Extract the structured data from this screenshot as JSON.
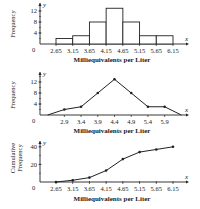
{
  "chart_data": [
    {
      "type": "bar",
      "subtype": "histogram",
      "title": "",
      "xlabel": "Milliequivalents per Liter",
      "ylabel": "Frequency",
      "x_axis_var": "x",
      "y_axis_var": "y",
      "origin_label": "0",
      "boundaries": [
        "2.65",
        "3.15",
        "3.65",
        "4.15",
        "4.65",
        "5.15",
        "5.65",
        "6.15"
      ],
      "categories": [
        "2.65-3.15",
        "3.15-3.65",
        "3.65-4.15",
        "4.15-4.65",
        "4.65-5.15",
        "5.15-5.65",
        "5.65-6.15"
      ],
      "values": [
        2,
        3,
        8,
        13,
        8,
        3,
        3
      ],
      "yticks": [
        "4",
        "8",
        "12"
      ],
      "ylim": [
        0,
        14
      ],
      "grid": false
    },
    {
      "type": "line",
      "subtype": "frequency polygon",
      "title": "",
      "xlabel": "Milliequivalents per Liter",
      "ylabel": "Frequency",
      "x_axis_var": "x",
      "y_axis_var": "y",
      "origin_label": "0",
      "xticks": [
        "2.9",
        "3.4",
        "3.9",
        "4.4",
        "4.9",
        "5.4",
        "5.9"
      ],
      "x": [
        2.4,
        2.9,
        3.4,
        3.9,
        4.4,
        4.9,
        5.4,
        5.9,
        6.4
      ],
      "values": [
        0,
        2,
        3,
        8,
        13,
        8,
        3,
        3,
        0
      ],
      "yticks": [
        "4",
        "8",
        "12"
      ],
      "ylim": [
        0,
        14
      ],
      "grid": false
    },
    {
      "type": "line",
      "subtype": "ogive",
      "title": "",
      "xlabel": "Milliequivalents per Liter",
      "ylabel": "Cumulative Frequency",
      "ylabel_lines": [
        "Cumulative",
        "Frequency"
      ],
      "x_axis_var": "x",
      "y_axis_var": "y",
      "origin_label": "0",
      "xticks": [
        "2.65",
        "3.15",
        "3.65",
        "4.15",
        "4.65",
        "5.15",
        "5.65",
        "6.15"
      ],
      "x": [
        2.65,
        3.15,
        3.65,
        4.15,
        4.65,
        5.15,
        5.65,
        6.15
      ],
      "values": [
        0,
        2,
        5,
        13,
        26,
        34,
        37,
        40
      ],
      "yticks": [
        "20",
        "40"
      ],
      "ylim": [
        0,
        45
      ],
      "grid": false
    }
  ]
}
